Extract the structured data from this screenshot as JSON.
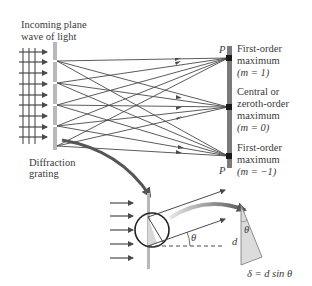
{
  "labels": {
    "incoming_line1": "Incoming plane",
    "incoming_line2": "wave of light",
    "grating_line1": "Diffraction",
    "grating_line2": "grating",
    "p_top": "P",
    "p_bottom": "P",
    "first_order_top_line1": "First-order",
    "first_order_top_line2": "maximum",
    "first_order_top_line3": "(m = 1)",
    "central_line1": "Central or",
    "central_line2": "zeroth-order",
    "central_line3": "maximum",
    "central_line4": "(m = 0)",
    "first_order_bottom_line1": "First-order",
    "first_order_bottom_line2": "maximum",
    "first_order_bottom_line3": "(m = −1)",
    "theta_angle": "θ",
    "theta_triangle": "θ",
    "d_label": "d",
    "path_difference": "δ = d sin θ"
  },
  "colors": {
    "ray": "#4a4a4a",
    "grating": "#b8b8b8",
    "screen": "#7a7a7a",
    "triangle_fill": "#dcdcdc",
    "text": "#3a3a3a"
  }
}
